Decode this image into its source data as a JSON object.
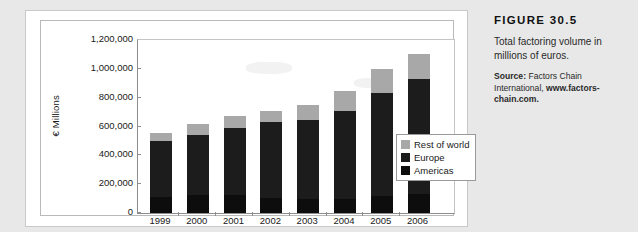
{
  "figure": {
    "number_label": "FIGURE 30.5",
    "caption": "Total factoring volume in millions of euros.",
    "source_prefix": "Source:",
    "source_body": " Factors Chain International, ",
    "source_url": "www.factors-chain.com."
  },
  "colors": {
    "americas": "#0d0d0d",
    "europe": "#1c1c1c",
    "rest_of_world": "#a8a8a8",
    "page_background": "#e8e8e8",
    "plot_background": "#ffffff",
    "axis": "#8d8d8d"
  },
  "chart_data": {
    "type": "bar",
    "subtype": "stacked-vertical",
    "title": "",
    "xlabel": "",
    "ylabel": "€ Millions",
    "ylim": [
      0,
      1200000
    ],
    "ytick_step": 200000,
    "ytick_labels": [
      "1,200,000",
      "1,000,000",
      "800,000",
      "600,000",
      "400,000",
      "200,000",
      "0"
    ],
    "ytick_values": [
      1200000,
      1000000,
      800000,
      600000,
      400000,
      200000,
      0
    ],
    "grid": false,
    "legend_position": "inside-right",
    "categories": [
      "1999",
      "2000",
      "2001",
      "2002",
      "2003",
      "2004",
      "2005",
      "2006"
    ],
    "series": [
      {
        "name": "Americas",
        "color": "#0d0d0d",
        "values": [
          110000,
          125000,
          125000,
          105000,
          100000,
          100000,
          120000,
          130000
        ]
      },
      {
        "name": "Europe",
        "color": "#1c1c1c",
        "values": [
          390000,
          415000,
          465000,
          525000,
          545000,
          610000,
          710000,
          800000
        ]
      },
      {
        "name": "Rest of world",
        "color": "#a8a8a8",
        "values": [
          55000,
          80000,
          85000,
          80000,
          105000,
          135000,
          170000,
          175000
        ]
      }
    ],
    "totals": [
      555000,
      620000,
      675000,
      710000,
      750000,
      845000,
      1000000,
      1105000
    ],
    "legend": [
      {
        "label": "Rest of world",
        "color": "#a8a8a8"
      },
      {
        "label": "Europe",
        "color": "#1c1c1c"
      },
      {
        "label": "Americas",
        "color": "#0d0d0d"
      }
    ]
  }
}
